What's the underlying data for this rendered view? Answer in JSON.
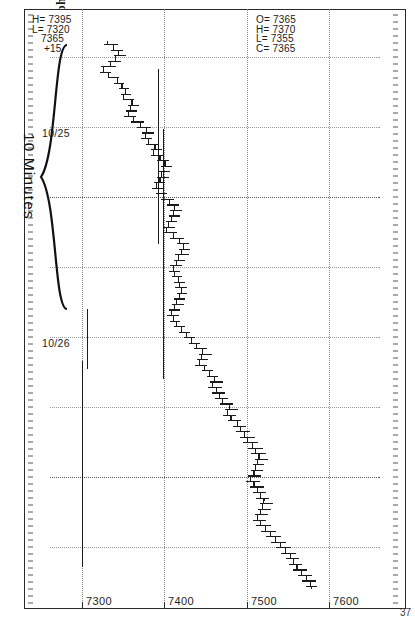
{
  "caption": "(Reprinted with Permission of Commodity Quote Graphics)",
  "chart_id": "37",
  "annotation": {
    "brace_label": "10 Minutes"
  },
  "quote_top": {
    "line1": "H= 7395",
    "line2": "L= 7320",
    "line3": "   7365",
    "line4": "    +15"
  },
  "quote_bottom": {
    "line1": "O= 7365",
    "line2": "H= 7370",
    "line3": "L= 7355",
    "line4": "C= 7365"
  },
  "chart_data": {
    "type": "bar",
    "title": "",
    "subtitle": "",
    "xlabel": "",
    "ylabel": "",
    "interval": "10 Minutes",
    "grid": true,
    "legend": null,
    "orientation": "rotated-90cw",
    "ylim": [
      7260,
      7660
    ],
    "yticks": [
      7600,
      7500,
      7400,
      7300
    ],
    "ytick_labels": [
      "7600",
      "7500",
      "7400",
      "7300"
    ],
    "xticks": [
      "10/25",
      "10/26"
    ],
    "xtick_labels": [
      "10/25",
      "10/26"
    ],
    "last_quote": {
      "high": 7395,
      "low": 7320,
      "last": 7365,
      "change": 15
    },
    "cursor_bar": {
      "open": 7365,
      "high": 7370,
      "low": 7355,
      "close": 7365
    },
    "series_name": "10-minute OHLC bars",
    "ohlc": [
      [
        7330,
        7342,
        7326,
        7338
      ],
      [
        7338,
        7348,
        7334,
        7344
      ],
      [
        7344,
        7352,
        7338,
        7340
      ],
      [
        7340,
        7346,
        7330,
        7334
      ],
      [
        7334,
        7340,
        7322,
        7326
      ],
      [
        7326,
        7334,
        7320,
        7332
      ],
      [
        7332,
        7344,
        7330,
        7342
      ],
      [
        7342,
        7350,
        7338,
        7348
      ],
      [
        7348,
        7356,
        7344,
        7352
      ],
      [
        7352,
        7358,
        7346,
        7350
      ],
      [
        7350,
        7362,
        7348,
        7360
      ],
      [
        7360,
        7368,
        7354,
        7358
      ],
      [
        7358,
        7366,
        7352,
        7356
      ],
      [
        7356,
        7364,
        7350,
        7362
      ],
      [
        7362,
        7374,
        7358,
        7370
      ],
      [
        7370,
        7382,
        7366,
        7378
      ],
      [
        7378,
        7386,
        7372,
        7376
      ],
      [
        7376,
        7384,
        7370,
        7380
      ],
      [
        7380,
        7392,
        7376,
        7388
      ],
      [
        7388,
        7396,
        7382,
        7386
      ],
      [
        7386,
        7398,
        7382,
        7394
      ],
      [
        7394,
        7404,
        7390,
        7400
      ],
      [
        7400,
        7408,
        7394,
        7398
      ],
      [
        7398,
        7406,
        7392,
        7396
      ],
      [
        7396,
        7404,
        7390,
        7394
      ],
      [
        7394,
        7400,
        7386,
        7390
      ],
      [
        7390,
        7398,
        7384,
        7392
      ],
      [
        7392,
        7402,
        7388,
        7398
      ],
      [
        7398,
        7410,
        7394,
        7406
      ],
      [
        7406,
        7416,
        7402,
        7412
      ],
      [
        7412,
        7420,
        7406,
        7410
      ],
      [
        7410,
        7418,
        7404,
        7408
      ],
      [
        7408,
        7414,
        7400,
        7404
      ],
      [
        7404,
        7412,
        7398,
        7402
      ],
      [
        7402,
        7414,
        7398,
        7410
      ],
      [
        7410,
        7422,
        7406,
        7418
      ],
      [
        7418,
        7428,
        7414,
        7422
      ],
      [
        7422,
        7430,
        7416,
        7420
      ],
      [
        7420,
        7428,
        7412,
        7416
      ],
      [
        7416,
        7424,
        7410,
        7414
      ],
      [
        7414,
        7420,
        7406,
        7410
      ],
      [
        7410,
        7418,
        7404,
        7412
      ],
      [
        7412,
        7420,
        7408,
        7416
      ],
      [
        7416,
        7424,
        7410,
        7418
      ],
      [
        7418,
        7426,
        7412,
        7420
      ],
      [
        7420,
        7426,
        7414,
        7418
      ],
      [
        7418,
        7424,
        7410,
        7414
      ],
      [
        7414,
        7422,
        7408,
        7412
      ],
      [
        7412,
        7418,
        7404,
        7408
      ],
      [
        7408,
        7416,
        7402,
        7410
      ],
      [
        7410,
        7418,
        7406,
        7414
      ],
      [
        7414,
        7424,
        7410,
        7420
      ],
      [
        7420,
        7430,
        7416,
        7426
      ],
      [
        7426,
        7436,
        7422,
        7432
      ],
      [
        7432,
        7442,
        7428,
        7438
      ],
      [
        7438,
        7450,
        7434,
        7446
      ],
      [
        7446,
        7456,
        7440,
        7444
      ],
      [
        7444,
        7452,
        7438,
        7442
      ],
      [
        7442,
        7450,
        7436,
        7448
      ],
      [
        7448,
        7458,
        7444,
        7454
      ],
      [
        7454,
        7464,
        7450,
        7460
      ],
      [
        7460,
        7470,
        7454,
        7458
      ],
      [
        7458,
        7468,
        7452,
        7462
      ],
      [
        7462,
        7472,
        7456,
        7466
      ],
      [
        7466,
        7476,
        7460,
        7470
      ],
      [
        7470,
        7482,
        7466,
        7478
      ],
      [
        7478,
        7488,
        7472,
        7476
      ],
      [
        7476,
        7486,
        7470,
        7480
      ],
      [
        7480,
        7492,
        7476,
        7488
      ],
      [
        7488,
        7498,
        7482,
        7492
      ],
      [
        7492,
        7502,
        7486,
        7496
      ],
      [
        7496,
        7508,
        7490,
        7500
      ],
      [
        7500,
        7512,
        7494,
        7506
      ],
      [
        7506,
        7518,
        7500,
        7510
      ],
      [
        7510,
        7522,
        7504,
        7514
      ],
      [
        7514,
        7524,
        7508,
        7512
      ],
      [
        7512,
        7520,
        7506,
        7510
      ],
      [
        7510,
        7518,
        7504,
        7508
      ],
      [
        7508,
        7516,
        7500,
        7504
      ],
      [
        7504,
        7514,
        7498,
        7508
      ],
      [
        7508,
        7520,
        7502,
        7512
      ],
      [
        7512,
        7522,
        7506,
        7516
      ],
      [
        7516,
        7526,
        7510,
        7520
      ],
      [
        7520,
        7530,
        7514,
        7518
      ],
      [
        7518,
        7528,
        7512,
        7516
      ],
      [
        7516,
        7524,
        7508,
        7512
      ],
      [
        7512,
        7522,
        7506,
        7516
      ],
      [
        7516,
        7528,
        7510,
        7522
      ],
      [
        7522,
        7534,
        7516,
        7528
      ],
      [
        7528,
        7540,
        7522,
        7534
      ],
      [
        7534,
        7546,
        7528,
        7540
      ],
      [
        7540,
        7552,
        7534,
        7546
      ],
      [
        7546,
        7558,
        7540,
        7552
      ],
      [
        7552,
        7562,
        7546,
        7556
      ],
      [
        7556,
        7566,
        7550,
        7560
      ],
      [
        7560,
        7572,
        7554,
        7566
      ],
      [
        7566,
        7578,
        7560,
        7572
      ],
      [
        7572,
        7582,
        7566,
        7576
      ],
      [
        7576,
        7584,
        7570,
        7578
      ]
    ]
  }
}
